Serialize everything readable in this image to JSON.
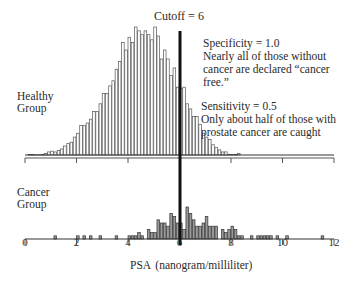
{
  "chart_data": {
    "type": "bar",
    "title": "",
    "xlabel": "PSA (nanogram/milliliter)",
    "ylabel": "",
    "xlim": [
      0,
      12
    ],
    "x_ticks": [
      0,
      2,
      4,
      6,
      8,
      10,
      12
    ],
    "x_tick_labels": [
      "0",
      "2",
      "4",
      "6",
      "8",
      "10",
      "12"
    ],
    "bin_width": 0.125,
    "cutoff": {
      "value": 6,
      "label": "Cutoff = 6"
    },
    "series": [
      {
        "name": "Healthy Group",
        "panel": "top",
        "bin_start": 0.125,
        "values": [
          0.5,
          0.3,
          0.2,
          0.2,
          0.5,
          1.2,
          2.4,
          3,
          2.4,
          3.5,
          4.7,
          7,
          9,
          10,
          14,
          17,
          23,
          23,
          25,
          28,
          34,
          34,
          40,
          48,
          48,
          54,
          58,
          67,
          73,
          88,
          82,
          92,
          88,
          100,
          97,
          94,
          97,
          94,
          90,
          100,
          93,
          75,
          82,
          75,
          62,
          68,
          53,
          52,
          53,
          40,
          36,
          30,
          30,
          24,
          17,
          14,
          12,
          8,
          6,
          4,
          2.4,
          2.4,
          0.5,
          0.3,
          0.3,
          1.2
        ],
        "fill": "#ffffff",
        "stroke": "#555555"
      },
      {
        "name": "Cancer Group",
        "panel": "bottom",
        "bin_start": 0.125,
        "values": [
          0,
          0,
          0,
          0,
          0,
          0,
          0,
          0,
          1,
          0,
          0,
          0,
          0,
          0,
          0,
          1,
          0,
          1,
          0,
          1,
          0,
          0,
          1,
          0,
          0,
          0,
          0,
          1,
          0,
          0,
          0,
          1,
          1,
          1,
          2,
          1,
          0,
          3,
          2,
          2,
          6,
          5,
          5,
          4,
          8,
          7,
          5,
          5,
          3,
          10,
          8,
          6,
          4,
          4,
          5,
          7,
          4,
          4,
          4,
          0,
          3,
          2,
          3,
          4,
          3,
          1,
          1,
          0,
          0,
          1,
          0,
          1,
          1,
          1,
          1,
          1,
          0,
          1,
          0,
          0,
          1,
          0,
          0,
          0,
          0,
          0,
          0,
          0,
          0,
          0,
          0,
          1
        ],
        "fill": "#999999",
        "stroke": "#333333"
      }
    ],
    "annotations": [
      {
        "title": "Specificity = 1.0",
        "text": [
          "Nearly all of those without",
          "cancer are declared “cancer",
          "free.”"
        ]
      },
      {
        "title": "Sensitivity = 0.5",
        "text": [
          "Only about half of those with",
          "prostate cancer are caught"
        ]
      }
    ],
    "group_labels": [
      {
        "lines": [
          "Healthy",
          "Group"
        ]
      },
      {
        "lines": [
          "Cancer",
          "Group"
        ]
      }
    ]
  }
}
